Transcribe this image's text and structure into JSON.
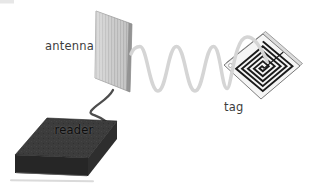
{
  "diagram": {
    "type": "rfid-system-illustration",
    "labels": {
      "antenna": "antenna",
      "reader": "reader",
      "tag": "tag"
    },
    "components": [
      "antenna-panel",
      "reader-device",
      "radio-wave",
      "rfid-tag",
      "coil",
      "cable"
    ],
    "colors": {
      "background": "#ffffff",
      "antenna_panel": "#c7c7c7",
      "antenna_panel_stripe": "#b7b7b7",
      "antenna_panel_edge": "#8f8f8f",
      "cable": "#4d4d4d",
      "reader_top": "#3c3c3c",
      "reader_front": "#262626",
      "reader_side": "#2e2e2e",
      "radio_wave": "#d5d5d5",
      "tag_face": "#f5f5f5",
      "tag_back": "#dcdcdc",
      "tag_outline": "#6f6f6f",
      "coil": "#1b1b1b",
      "label_text": "#3d3d3d",
      "reader_label_text": "#0d0d0d"
    }
  }
}
